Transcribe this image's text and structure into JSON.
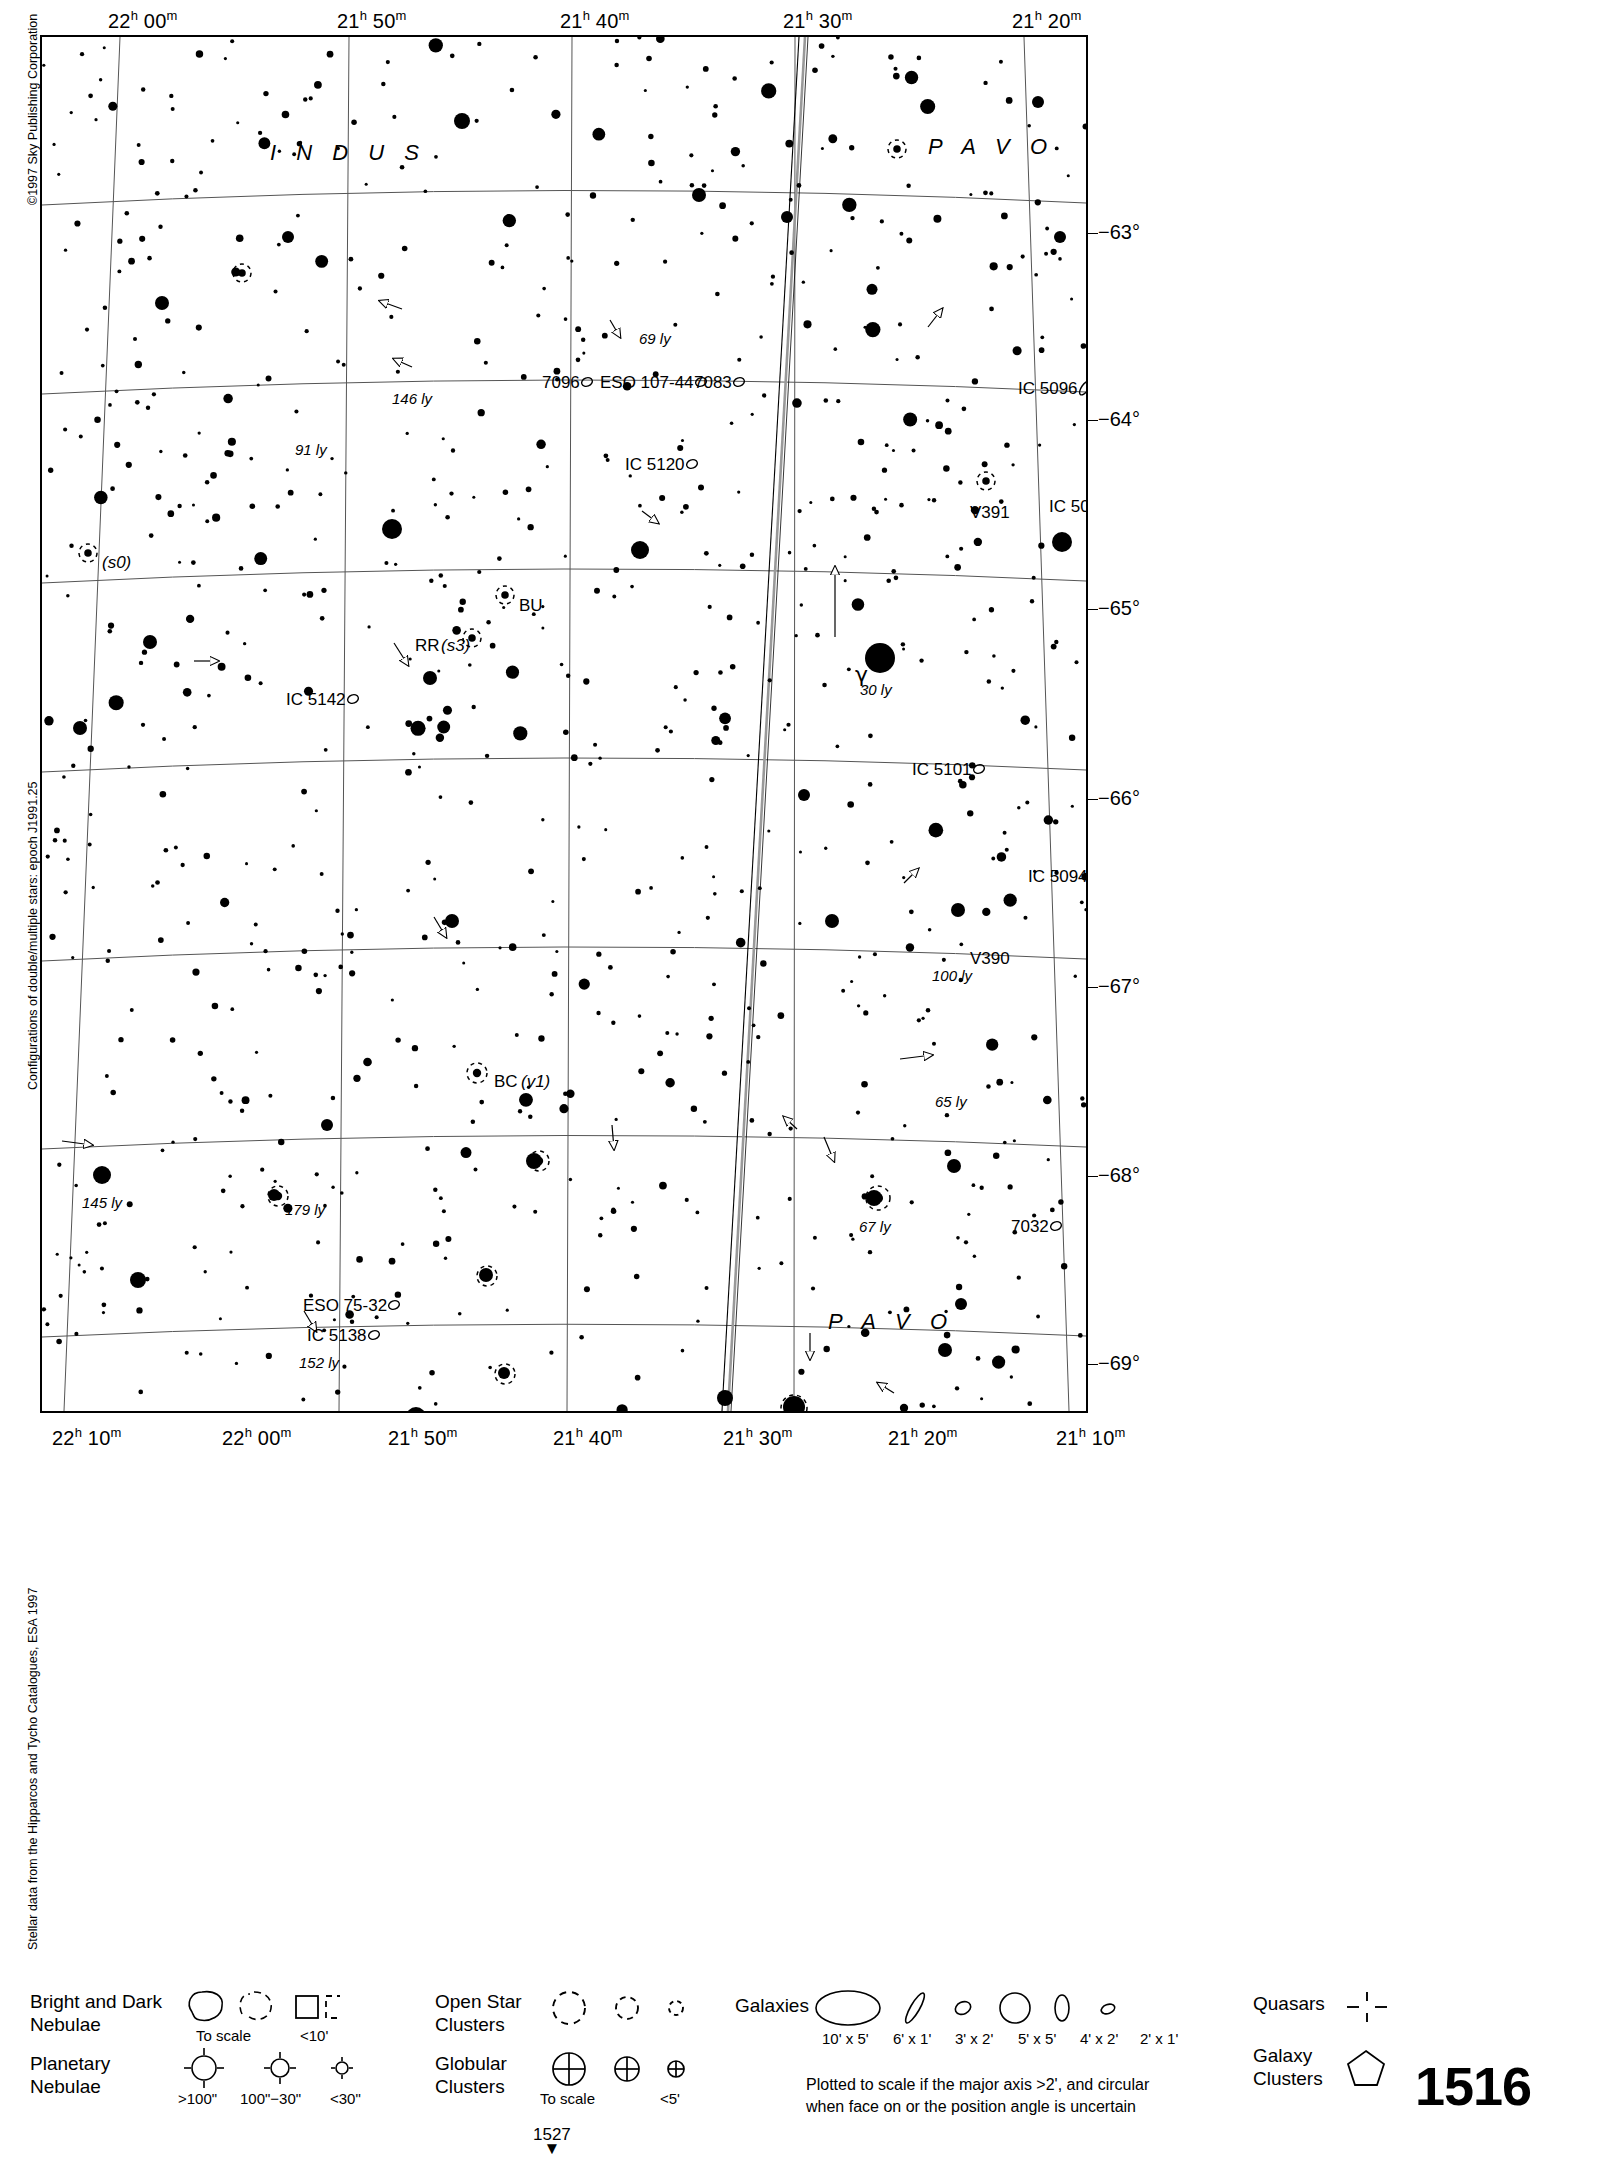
{
  "chart": {
    "number": "1516",
    "page_marker": "1527",
    "copyright": "©1997 Sky Publishing Corporation",
    "note_left_mid": "Configurations of double/multiple stars: epoch J1991.25",
    "note_left_bottom": "Stellar data from the Hipparcos and Tycho Catalogues, ESA 1997"
  },
  "axes": {
    "ra_top": [
      {
        "label": "22ʰ 00ᵐ",
        "h": "22",
        "m": "00",
        "x": 118
      },
      {
        "label": "21ʰ 50ᵐ",
        "h": "21",
        "m": "50",
        "x": 347
      },
      {
        "label": "21ʰ 40ᵐ",
        "h": "21",
        "m": "40",
        "x": 570
      },
      {
        "label": "21ʰ 30ᵐ",
        "h": "21",
        "m": "30",
        "x": 793
      },
      {
        "label": "21ʰ 20ᵐ",
        "h": "21",
        "m": "20",
        "x": 1022
      }
    ],
    "ra_bottom": [
      {
        "label": "22ʰ 10ᵐ",
        "h": "22",
        "m": "10",
        "x": 62
      },
      {
        "label": "22ʰ 00ᵐ",
        "h": "22",
        "m": "00",
        "x": 232
      },
      {
        "label": "21ʰ 50ᵐ",
        "h": "21",
        "m": "50",
        "x": 398
      },
      {
        "label": "21ʰ 40ᵐ",
        "h": "21",
        "m": "40",
        "x": 563
      },
      {
        "label": "21ʰ 30ᵐ",
        "h": "21",
        "m": "30",
        "x": 733
      },
      {
        "label": "21ʰ 20ᵐ",
        "h": "21",
        "m": "20",
        "x": 898
      },
      {
        "label": "21ʰ 10ᵐ",
        "h": "21",
        "m": "10",
        "x": 1066
      }
    ],
    "dec_right": [
      {
        "label": "−63°",
        "y": 196
      },
      {
        "label": "−64°",
        "y": 383
      },
      {
        "label": "−65°",
        "y": 572
      },
      {
        "label": "−66°",
        "y": 762
      },
      {
        "label": "−67°",
        "y": 950
      },
      {
        "label": "−68°",
        "y": 1139
      },
      {
        "label": "−69°",
        "y": 1327
      }
    ]
  },
  "constellations": [
    {
      "name": "I N D U S",
      "x": 228,
      "y": 103
    },
    {
      "name": "P A V O",
      "x": 886,
      "y": 97
    },
    {
      "name": "P A V O",
      "x": 786,
      "y": 1272
    },
    {
      "name": "I N D U S",
      "x": 560,
      "y": 1394
    }
  ],
  "deep_sky": [
    {
      "label": "7096",
      "x": 500,
      "y": 337,
      "sym": "galaxy-small"
    },
    {
      "label": "ESO 107-44",
      "x": 558,
      "y": 337,
      "sym": "galaxy-small"
    },
    {
      "label": "7083",
      "x": 652,
      "y": 337,
      "sym": "galaxy-small"
    },
    {
      "label": "IC 5096",
      "x": 976,
      "y": 343,
      "sym": "galaxy-edge"
    },
    {
      "label": "IC 5120",
      "x": 583,
      "y": 419,
      "sym": "galaxy-small"
    },
    {
      "label": "IC 5092",
      "x": 1007,
      "y": 461,
      "sym": "galaxy-small"
    },
    {
      "label": "IC 5142",
      "x": 244,
      "y": 654,
      "sym": "galaxy-small"
    },
    {
      "label": "IC 5101",
      "x": 870,
      "y": 724,
      "sym": "galaxy-small"
    },
    {
      "label": "IC 5094",
      "x": 986,
      "y": 831,
      "sym": "galaxy-small"
    },
    {
      "label": "7032",
      "x": 969,
      "y": 1181,
      "sym": "galaxy-small"
    },
    {
      "label": "ESO 75-32",
      "x": 261,
      "y": 1260,
      "sym": "galaxy-small"
    },
    {
      "label": "IC 5138",
      "x": 265,
      "y": 1290,
      "sym": "galaxy-small"
    }
  ],
  "star_labels": [
    {
      "label": "(s0)",
      "x": 60,
      "y": 517,
      "style": "ital"
    },
    {
      "label": "BU",
      "x": 477,
      "y": 560,
      "style": "plain"
    },
    {
      "label": "RR",
      "x": 373,
      "y": 600,
      "style": "plain"
    },
    {
      "label": "(s3)",
      "x": 399,
      "y": 600,
      "style": "ital"
    },
    {
      "label": "V391",
      "x": 928,
      "y": 467,
      "style": "plain"
    },
    {
      "label": "V390",
      "x": 928,
      "y": 913,
      "style": "plain"
    },
    {
      "label": "BC",
      "x": 452,
      "y": 1036,
      "style": "plain"
    },
    {
      "label": "(v1)",
      "x": 479,
      "y": 1036,
      "style": "ital"
    },
    {
      "label": "SX",
      "x": 769,
      "y": 1403,
      "style": "plain"
    },
    {
      "label": "(s)",
      "x": 795,
      "y": 1403,
      "style": "ital"
    },
    {
      "label": "γ",
      "x": 813,
      "y": 625,
      "style": "greek"
    }
  ],
  "distance_labels": [
    {
      "label": "69 ly",
      "x": 597,
      "y": 294
    },
    {
      "label": "146 ly",
      "x": 350,
      "y": 354
    },
    {
      "label": "91 ly",
      "x": 253,
      "y": 405
    },
    {
      "label": "30 ly",
      "x": 818,
      "y": 645
    },
    {
      "label": "100 ly",
      "x": 890,
      "y": 931
    },
    {
      "label": "65 ly",
      "x": 893,
      "y": 1057
    },
    {
      "label": "145 ly",
      "x": 40,
      "y": 1158
    },
    {
      "label": "179 ly",
      "x": 243,
      "y": 1165
    },
    {
      "label": "67 ly",
      "x": 817,
      "y": 1182
    },
    {
      "label": "152 ly",
      "x": 257,
      "y": 1318
    }
  ],
  "legend": {
    "nebulae": {
      "title_line1": "Bright and Dark",
      "title_line2": "Nebulae",
      "sub_scale": "To scale",
      "sub_small": "<10'"
    },
    "planetary": {
      "title_line1": "Planetary",
      "title_line2": "Nebulae",
      "sub_large": ">100\"",
      "sub_mid": "100\"−30\"",
      "sub_small": "<30\""
    },
    "open_clusters": {
      "title_line1": "Open Star",
      "title_line2": "Clusters"
    },
    "globular_clusters": {
      "title_line1": "Globular",
      "title_line2": "Clusters",
      "sub_scale": "To scale",
      "sub_small": "<5'"
    },
    "galaxies": {
      "title": "Galaxies",
      "sizes": [
        "10' x 5'",
        "6' x 1'",
        "3' x 2'",
        "5' x 5'",
        "4' x 2'",
        "2' x 1'"
      ],
      "note_line1": "Plotted to scale if the major axis >2', and circular",
      "note_line2": "when face on or the position angle is uncertain"
    },
    "quasars": {
      "title": "Quasars"
    },
    "galaxy_clusters": {
      "title_line1": "Galaxy",
      "title_line2": "Clusters"
    }
  },
  "chart_data": {
    "type": "scatter",
    "xlabel": "Right Ascension",
    "ylabel": "Declination",
    "xlim": [
      "22h 10m",
      "21h 10m"
    ],
    "ylim": [
      -62.4,
      -69.4
    ],
    "grid": true,
    "legend": "bottom",
    "note": "Star positions are plotted as filled discs whose radius encodes magnitude; deep-sky objects use open symbols."
  }
}
